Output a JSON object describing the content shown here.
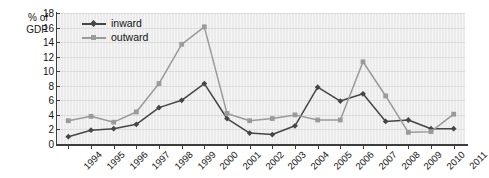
{
  "chart_data": {
    "type": "line",
    "title": "",
    "xlabel": "",
    "ylabel": "% of\nGDP",
    "ylim": [
      0,
      18
    ],
    "yticks": [
      0,
      2,
      4,
      6,
      8,
      10,
      12,
      14,
      16,
      18
    ],
    "grid": true,
    "legend_position": "top-left",
    "categories": [
      "1994",
      "1995",
      "1996",
      "1997",
      "1998",
      "1999",
      "2000",
      "2001",
      "2002",
      "2003",
      "2004",
      "2005",
      "2006",
      "2007",
      "2008",
      "2009",
      "2010",
      "2011"
    ],
    "series": [
      {
        "name": "inward",
        "color": "#464646",
        "marker": "diamond",
        "values": [
          1.0,
          1.9,
          2.1,
          2.7,
          5.0,
          6.0,
          8.3,
          3.5,
          1.5,
          1.3,
          2.5,
          7.8,
          5.9,
          6.9,
          3.1,
          3.3,
          2.1,
          2.1
        ]
      },
      {
        "name": "outward",
        "color": "#9a9a9a",
        "marker": "square",
        "values": [
          3.2,
          3.8,
          3.0,
          4.4,
          8.3,
          13.7,
          16.1,
          4.2,
          3.2,
          3.5,
          4.0,
          3.3,
          3.3,
          11.3,
          6.6,
          1.6,
          1.7,
          4.1
        ]
      }
    ]
  },
  "axis": {
    "y_title_line1": "% of",
    "y_title_line2": "GDP"
  },
  "colors": {
    "plot_background": "#ebebeb",
    "axis": "#3d3d3d",
    "grid": "#dcdcdc",
    "inward": "#464646",
    "outward": "#9a9a9a",
    "text": "#141414"
  }
}
